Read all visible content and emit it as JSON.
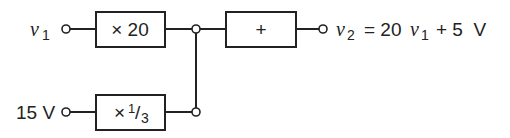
{
  "diagram": {
    "inputs": [
      {
        "id": "v1",
        "label": "v",
        "subscript": "1"
      },
      {
        "id": "v15",
        "label": "15 V"
      }
    ],
    "blocks": [
      {
        "id": "gain20",
        "label": "× 20"
      },
      {
        "id": "gain13",
        "label_prefix": "×",
        "label_num": "1",
        "label_slash": "/",
        "label_den": "3"
      },
      {
        "id": "sum",
        "label": "+"
      }
    ],
    "output": {
      "var": "v",
      "var_sub": "2",
      "eq": "= 20",
      "var2": "v",
      "var2_sub": "1",
      "rest": "+ 5  V"
    },
    "colors": {
      "stroke": "#222222",
      "background": "#ffffff"
    }
  }
}
